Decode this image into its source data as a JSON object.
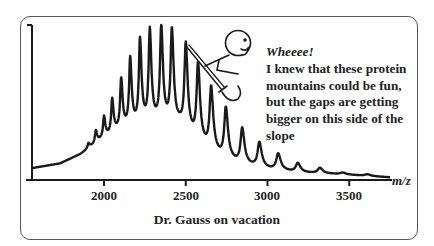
{
  "chart_data": {
    "type": "line",
    "title": "",
    "xlabel": "m/z",
    "ylabel": "",
    "xlim": [
      1560,
      3770
    ],
    "ylim": [
      0,
      100
    ],
    "xticks": [
      2000,
      2500,
      3000,
      3500
    ],
    "grid": false,
    "legend": null,
    "peaks": [
      {
        "mz": 1725,
        "intensity": 8
      },
      {
        "mz": 1770,
        "intensity": 9
      },
      {
        "mz": 1810,
        "intensity": 12
      },
      {
        "mz": 1860,
        "intensity": 16
      },
      {
        "mz": 1905,
        "intensity": 23
      },
      {
        "mz": 1950,
        "intensity": 31
      },
      {
        "mz": 2000,
        "intensity": 40
      },
      {
        "mz": 2050,
        "intensity": 51
      },
      {
        "mz": 2105,
        "intensity": 64
      },
      {
        "mz": 2160,
        "intensity": 77
      },
      {
        "mz": 2220,
        "intensity": 89
      },
      {
        "mz": 2280,
        "intensity": 95
      },
      {
        "mz": 2350,
        "intensity": 97
      },
      {
        "mz": 2415,
        "intensity": 95
      },
      {
        "mz": 2500,
        "intensity": 86
      },
      {
        "mz": 2575,
        "intensity": 73
      },
      {
        "mz": 2655,
        "intensity": 58
      },
      {
        "mz": 2745,
        "intensity": 45
      },
      {
        "mz": 2845,
        "intensity": 32
      },
      {
        "mz": 2950,
        "intensity": 23
      },
      {
        "mz": 3065,
        "intensity": 16
      },
      {
        "mz": 3185,
        "intensity": 10
      },
      {
        "mz": 3320,
        "intensity": 7
      },
      {
        "mz": 3460,
        "intensity": 4
      },
      {
        "mz": 3610,
        "intensity": 3
      }
    ],
    "baseline": [
      {
        "mz": 1560,
        "intensity": 7
      },
      {
        "mz": 1730,
        "intensity": 10
      },
      {
        "mz": 1855,
        "intensity": 16
      },
      {
        "mz": 1975,
        "intensity": 25
      },
      {
        "mz": 2100,
        "intensity": 32
      },
      {
        "mz": 2220,
        "intensity": 35
      },
      {
        "mz": 2345,
        "intensity": 36
      },
      {
        "mz": 2465,
        "intensity": 34
      },
      {
        "mz": 2590,
        "intensity": 22
      },
      {
        "mz": 2710,
        "intensity": 14
      },
      {
        "mz": 2835,
        "intensity": 9
      },
      {
        "mz": 3015,
        "intensity": 6
      },
      {
        "mz": 3200,
        "intensity": 4
      },
      {
        "mz": 3445,
        "intensity": 3
      },
      {
        "mz": 3750,
        "intensity": 1
      }
    ],
    "annotations": [
      "Wheeee!",
      "I knew that these protein mountains could be fun, but the gaps are getting bigger on this side of the slope",
      "Dr. Gauss on vacation"
    ]
  },
  "axis": {
    "x_label": "m/z",
    "tick_labels": [
      "2000",
      "2500",
      "3000",
      "3500"
    ]
  },
  "speech": {
    "exclaim": "Wheeee!",
    "lines": [
      "I knew that these protein",
      "mountains could be fun,",
      "but the gaps are getting",
      "bigger on this side of the",
      "slope"
    ]
  },
  "caption": "Dr. Gauss on vacation",
  "colors": {
    "ink": "#1a1a1a",
    "frame": "#555555",
    "background": "#ffffff"
  }
}
